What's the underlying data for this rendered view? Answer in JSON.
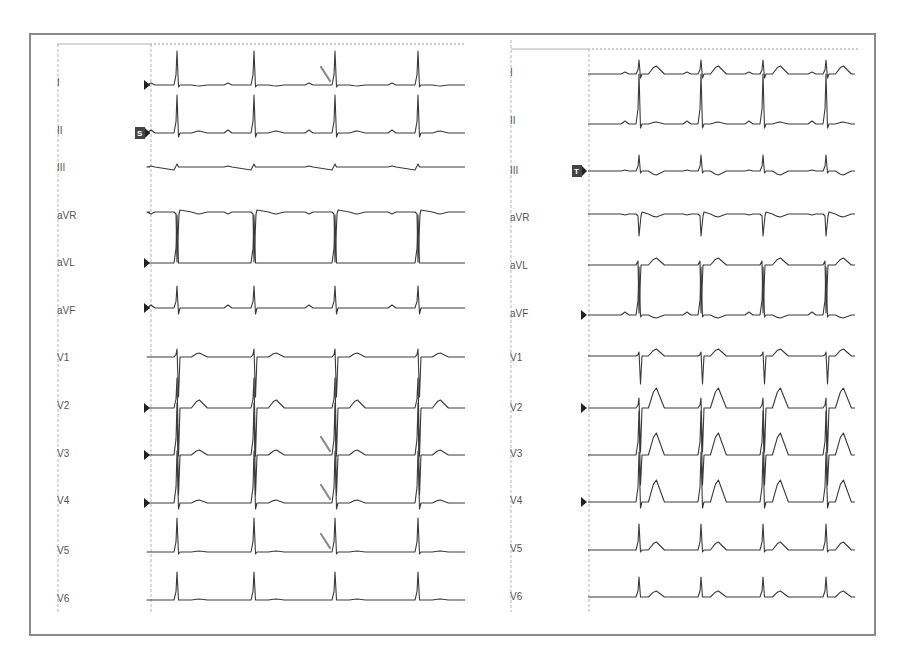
{
  "chart_data": {
    "type": "line",
    "title": "",
    "panels": [
      {
        "name": "left",
        "leads": [
          "I",
          "II",
          "III",
          "aVR",
          "aVL",
          "aVF",
          "V1",
          "V2",
          "V3",
          "V4",
          "V5",
          "V6"
        ],
        "beats_per_lead": 4,
        "qrs_x_px": [
          177,
          254,
          335,
          418
        ],
        "markers": {
          "start_triangles_on": [
            "I",
            "II",
            "aVL",
            "aVF",
            "V2",
            "V3",
            "V4"
          ],
          "boxed_marker": {
            "lead": "II",
            "text": "S"
          }
        },
        "annotation_arrows": [
          {
            "lead": "I",
            "beat": 3
          },
          {
            "lead": "V3",
            "beat": 3
          },
          {
            "lead": "V4",
            "beat": 3
          },
          {
            "lead": "V5",
            "beat": 3
          }
        ],
        "notes": "Short PR / delta wave (slurred upstroke) indicated by arrows before the 3rd QRS in I, V3, V4, V5"
      },
      {
        "name": "right",
        "leads": [
          "I",
          "II",
          "III",
          "aVR",
          "aVL",
          "aVF",
          "V1",
          "V2",
          "V3",
          "V4",
          "V5",
          "V6"
        ],
        "beats_per_lead": 4,
        "qrs_x_px": [
          639,
          701,
          763,
          826
        ],
        "markers": {
          "start_triangles_on": [
            "aVF",
            "V2",
            "V4"
          ],
          "boxed_marker": {
            "lead": "III",
            "text": "T"
          }
        },
        "notes": "Normal conduction with prominent T waves in V2-V4"
      }
    ],
    "xlabel": "",
    "ylabel": "",
    "grid": false,
    "legend": "none"
  },
  "left_panel": {
    "labels": [
      "I",
      "II",
      "III",
      "aVR",
      "aVL",
      "aVF",
      "V1",
      "V2",
      "V3",
      "V4",
      "V5",
      "V6"
    ],
    "boxed_marker": "S"
  },
  "right_panel": {
    "labels": [
      "I",
      "II",
      "III",
      "aVR",
      "aVL",
      "aVF",
      "V1",
      "V2",
      "V3",
      "V4",
      "V5",
      "V6"
    ],
    "boxed_marker": "T"
  }
}
